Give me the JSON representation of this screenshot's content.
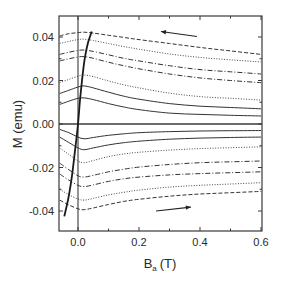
{
  "chart_data": {
    "type": "line",
    "title": "",
    "xlabel": "B_a (T)",
    "xlabel_main": "B",
    "xlabel_sub": "a",
    "xlabel_unit": "(T)",
    "ylabel": "M (emu)",
    "xlim": [
      -0.062,
      0.6
    ],
    "ylim": [
      -0.049,
      0.05
    ],
    "grid": false,
    "legend": null,
    "x_ticks": [
      {
        "value": 0.0,
        "label": "0.0"
      },
      {
        "value": 0.2,
        "label": "0.2"
      },
      {
        "value": 0.4,
        "label": "0.4"
      },
      {
        "value": 0.6,
        "label": "0.6"
      }
    ],
    "x_minor_ticks": [
      0.1,
      0.3,
      0.5
    ],
    "y_ticks": [
      {
        "value": 0.04,
        "label": "0.04"
      },
      {
        "value": 0.02,
        "label": "0.02"
      },
      {
        "value": 0.0,
        "label": "0.00"
      },
      {
        "value": -0.02,
        "label": "-0.02"
      },
      {
        "value": -0.04,
        "label": "-0.04"
      }
    ],
    "y_minor_ticks": [
      0.03,
      0.01,
      -0.01,
      -0.03
    ],
    "reference_lines": [
      {
        "orientation": "vertical",
        "value": 0.0
      },
      {
        "orientation": "horizontal",
        "value": 0.0
      }
    ],
    "annotations": [
      {
        "type": "arrow",
        "direction": "left",
        "from": [
          0.39,
          0.0402
        ],
        "to": [
          0.272,
          0.0425
        ],
        "meaning": "decreasing field branch"
      },
      {
        "type": "arrow",
        "direction": "right",
        "from": [
          0.256,
          -0.04
        ],
        "to": [
          0.37,
          -0.0382
        ],
        "meaning": "increasing field branch"
      }
    ],
    "x": [
      -0.06,
      -0.03,
      0.0,
      0.02,
      0.05,
      0.1,
      0.15,
      0.2,
      0.3,
      0.4,
      0.5,
      0.6
    ],
    "series": [
      {
        "name": "upper-1",
        "style": "dashed",
        "values": [
          0.0405,
          0.0415,
          0.042,
          0.0422,
          0.0418,
          0.0408,
          0.0398,
          0.0388,
          0.037,
          0.0352,
          0.0336,
          0.032
        ]
      },
      {
        "name": "upper-2",
        "style": "dotted",
        "values": [
          0.037,
          0.038,
          0.0388,
          0.039,
          0.0384,
          0.037,
          0.0356,
          0.0344,
          0.0322,
          0.0306,
          0.0295,
          0.0285
        ]
      },
      {
        "name": "upper-3",
        "style": "dashdot",
        "values": [
          0.032,
          0.033,
          0.0338,
          0.034,
          0.0334,
          0.0318,
          0.0302,
          0.029,
          0.0268,
          0.025,
          0.024,
          0.023
        ]
      },
      {
        "name": "upper-4",
        "style": "dashdot",
        "values": [
          0.029,
          0.03,
          0.0308,
          0.031,
          0.0302,
          0.0284,
          0.0268,
          0.0254,
          0.023,
          0.0212,
          0.02,
          0.019
        ]
      },
      {
        "name": "upper-5",
        "style": "dotted",
        "values": [
          0.019,
          0.0205,
          0.022,
          0.0225,
          0.0218,
          0.0198,
          0.018,
          0.0166,
          0.0142,
          0.0126,
          0.0118,
          0.011
        ]
      },
      {
        "name": "upper-6",
        "style": "solid",
        "values": [
          0.014,
          0.0155,
          0.017,
          0.0175,
          0.0166,
          0.0146,
          0.0128,
          0.0114,
          0.0094,
          0.0082,
          0.0076,
          0.007
        ]
      },
      {
        "name": "upper-7",
        "style": "solid",
        "values": [
          0.009,
          0.0105,
          0.0118,
          0.012,
          0.0112,
          0.0094,
          0.0078,
          0.0066,
          0.005,
          0.0044,
          0.004,
          0.0037
        ]
      },
      {
        "name": "lower-1",
        "style": "solid",
        "values": [
          -0.0025,
          -0.004,
          -0.006,
          -0.0068,
          -0.0062,
          -0.0052,
          -0.0045,
          -0.004,
          -0.0035,
          -0.0032,
          -0.0031,
          -0.003
        ]
      },
      {
        "name": "lower-2",
        "style": "solid",
        "values": [
          -0.006,
          -0.0085,
          -0.011,
          -0.0118,
          -0.011,
          -0.0096,
          -0.0086,
          -0.0079,
          -0.007,
          -0.0065,
          -0.0062,
          -0.006
        ]
      },
      {
        "name": "lower-3",
        "style": "dotted",
        "values": [
          -0.011,
          -0.014,
          -0.017,
          -0.0178,
          -0.0168,
          -0.015,
          -0.0138,
          -0.013,
          -0.012,
          -0.0113,
          -0.0109,
          -0.0105
        ]
      },
      {
        "name": "lower-4",
        "style": "dashdot",
        "values": [
          -0.018,
          -0.021,
          -0.0238,
          -0.0244,
          -0.0236,
          -0.022,
          -0.0208,
          -0.0198,
          -0.0186,
          -0.0178,
          -0.0174,
          -0.017
        ]
      },
      {
        "name": "lower-5",
        "style": "dashdot",
        "values": [
          -0.023,
          -0.0258,
          -0.0282,
          -0.0288,
          -0.028,
          -0.0264,
          -0.0252,
          -0.0244,
          -0.0234,
          -0.0228,
          -0.0224,
          -0.022
        ]
      },
      {
        "name": "lower-6",
        "style": "dotted",
        "values": [
          -0.03,
          -0.0325,
          -0.0345,
          -0.035,
          -0.0342,
          -0.0326,
          -0.0314,
          -0.0304,
          -0.029,
          -0.0282,
          -0.0276,
          -0.027
        ]
      },
      {
        "name": "lower-7",
        "style": "dashed",
        "values": [
          -0.035,
          -0.0372,
          -0.039,
          -0.0394,
          -0.0386,
          -0.037,
          -0.0356,
          -0.0346,
          -0.0332,
          -0.0322,
          -0.0316,
          -0.031
        ]
      }
    ],
    "virgin_curve": {
      "name": "envelope",
      "style": "solid-bold",
      "points": [
        [
          -0.045,
          -0.0425
        ],
        [
          -0.03,
          -0.033
        ],
        [
          -0.018,
          -0.022
        ],
        [
          -0.008,
          -0.01
        ],
        [
          0.0,
          0.0
        ],
        [
          0.006,
          0.01
        ],
        [
          0.013,
          0.02
        ],
        [
          0.022,
          0.03
        ],
        [
          0.032,
          0.037
        ],
        [
          0.045,
          0.0425
        ]
      ]
    }
  },
  "colors": {
    "axis": "#3a3a3a",
    "curve": "#333333",
    "background": "#ffffff"
  }
}
